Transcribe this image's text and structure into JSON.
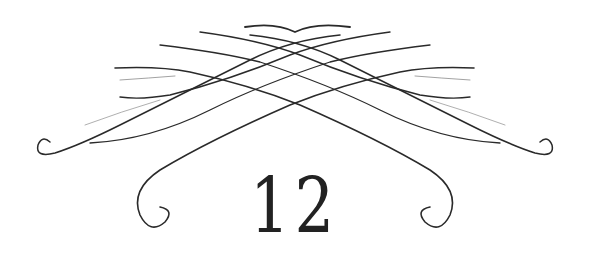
{
  "ornament": {
    "number": "12",
    "stroke_color": "#2a2a2a",
    "background": "#ffffff",
    "icon": "chapter-flourish-ornament"
  }
}
